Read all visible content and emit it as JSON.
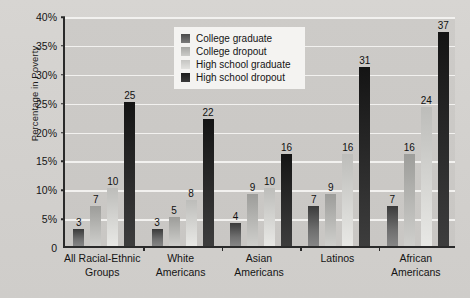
{
  "chart_data": {
    "type": "bar",
    "title": "",
    "xlabel": "",
    "ylabel": "Percentage in Poverty",
    "ylim": [
      0,
      40
    ],
    "ytick_labels": [
      "0",
      "5%",
      "10%",
      "15%",
      "20%",
      "25%",
      "30%",
      "35%",
      "40%"
    ],
    "ytick_values": [
      0,
      5,
      10,
      15,
      20,
      25,
      30,
      35,
      40
    ],
    "grid": true,
    "legend_position": "top-center",
    "categories": [
      "All Racial-Ethnic Groups",
      "White Americans",
      "Asian Americans",
      "Latinos",
      "African Americans"
    ],
    "category_lines": [
      [
        "All Racial-Ethnic",
        "Groups"
      ],
      [
        "White",
        "Americans"
      ],
      [
        "Asian",
        "Americans"
      ],
      [
        "Latinos",
        ""
      ],
      [
        "African",
        "Americans"
      ]
    ],
    "series": [
      {
        "name": "College graduate",
        "color": "#4a4a4a",
        "values": [
          3,
          3,
          4,
          7,
          7
        ]
      },
      {
        "name": "College dropout",
        "color": "#a9a9a6",
        "values": [
          7,
          5,
          9,
          9,
          16
        ]
      },
      {
        "name": "High school graduate",
        "color": "#c8c8c5",
        "values": [
          10,
          8,
          10,
          16,
          24
        ]
      },
      {
        "name": "High school dropout",
        "color": "#1d1d1d",
        "values": [
          25,
          22,
          16,
          31,
          37
        ]
      }
    ]
  }
}
